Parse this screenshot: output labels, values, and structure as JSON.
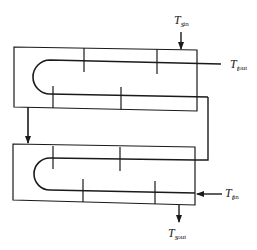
{
  "diagram": {
    "colors": {
      "line": "#1a1a1a",
      "background": "#ffffff"
    },
    "labels": {
      "shell_in": {
        "main": "T",
        "sub": "s",
        "subsub": "in"
      },
      "tube_out": {
        "main": "T",
        "sub": "t",
        "subsub": "out"
      },
      "tube_in": {
        "main": "T",
        "sub": "t",
        "subsub": "in"
      },
      "shell_out": {
        "main": "T",
        "sub": "s",
        "subsub": "out"
      }
    },
    "shells": [
      {
        "name": "upper-shell",
        "baffles_top": 2,
        "baffles_bottom": 2
      },
      {
        "name": "lower-shell",
        "baffles_top": 2,
        "baffles_bottom": 2
      }
    ]
  }
}
